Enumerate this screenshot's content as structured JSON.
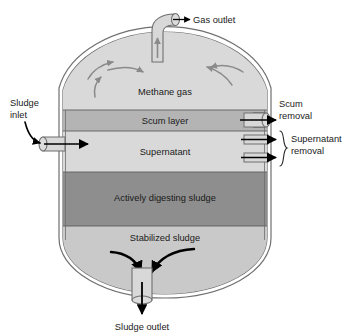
{
  "figure": {
    "type": "process-diagram"
  },
  "tank": {
    "name": "digester-tank",
    "wall_color": "#8c8c8c",
    "wall_inner_color": "#ffffff",
    "layers": [
      {
        "id": "methane-gas",
        "label": "Methane gas",
        "color": "#d6d6d6",
        "order": 1
      },
      {
        "id": "scum-layer",
        "label": "Scum layer",
        "color": "#b5b5b5",
        "order": 2
      },
      {
        "id": "supernatant",
        "label": "Supernatant",
        "color": "#d6d6d6",
        "order": 3
      },
      {
        "id": "actively-digesting-sludge",
        "label": "Actively digesting sludge",
        "color": "#8f8f8f",
        "order": 4
      },
      {
        "id": "stabilized-sludge",
        "label": "Stabilized sludge",
        "color": "#c9c9c9",
        "order": 5
      }
    ]
  },
  "ports": {
    "gas_outlet": {
      "label": "Gas outlet",
      "position": "top",
      "flow": "out"
    },
    "sludge_inlet": {
      "label_line1": "Sludge",
      "label_line2": "inlet",
      "label": "Sludge inlet",
      "position": "left",
      "flow": "in"
    },
    "scum_removal": {
      "label_line1": "Scum",
      "label_line2": "removal",
      "label": "Scum removal",
      "position": "right",
      "flow": "out"
    },
    "supernatant_removal": {
      "label_line1": "Supernatant",
      "label_line2": "removal",
      "label": "Supernatant removal",
      "position": "right",
      "flow": "out",
      "pipe_count": 2
    },
    "sludge_outlet": {
      "label": "Sludge outlet",
      "position": "bottom",
      "flow": "out"
    }
  },
  "flow_arrows": {
    "gas_circulation_count": 6,
    "gas_arrow_color": "#8a8a8a",
    "sludge_convergence_count": 2,
    "sludge_arrow_color": "#000000"
  },
  "colors": {
    "background": "#ffffff",
    "text": "#1a1a1a",
    "outline": "#6b6b6b",
    "pipe_fill": "#d2d2d2",
    "arrow_black": "#000000"
  }
}
